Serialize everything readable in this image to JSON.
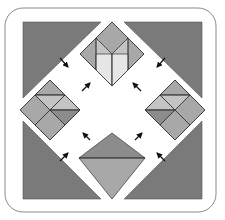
{
  "diagram": {
    "type": "quilt-block-assembly",
    "frame": {
      "stroke": "#8a8a8a",
      "fill": "#ffffff",
      "corner_radius": 18
    },
    "colors": {
      "corner_triangle": "#7a7a7a",
      "dark": "#8c8c8c",
      "medium": "#a8a8a8",
      "light": "#c4c4c4",
      "lightest": "#e6e6e6",
      "seam": "#333333",
      "arrow": "#111111"
    },
    "corner_triangles": [
      "top-left",
      "top-right",
      "bottom-left",
      "bottom-right"
    ],
    "units": [
      {
        "id": "top",
        "label": "top diamond unit"
      },
      {
        "id": "left",
        "label": "left diamond unit"
      },
      {
        "id": "right",
        "label": "right diamond unit"
      },
      {
        "id": "bottom",
        "label": "bottom triangle unit"
      }
    ],
    "arrows": [
      {
        "position": "upper-left-outer",
        "direction": "down-right"
      },
      {
        "position": "upper-left-inner",
        "direction": "up-right"
      },
      {
        "position": "upper-right-outer",
        "direction": "down-left"
      },
      {
        "position": "upper-right-inner",
        "direction": "up-left"
      },
      {
        "position": "lower-left-outer",
        "direction": "up-right"
      },
      {
        "position": "lower-left-inner",
        "direction": "up-left"
      },
      {
        "position": "lower-right-outer",
        "direction": "up-left"
      },
      {
        "position": "lower-right-inner",
        "direction": "up-right"
      }
    ]
  }
}
